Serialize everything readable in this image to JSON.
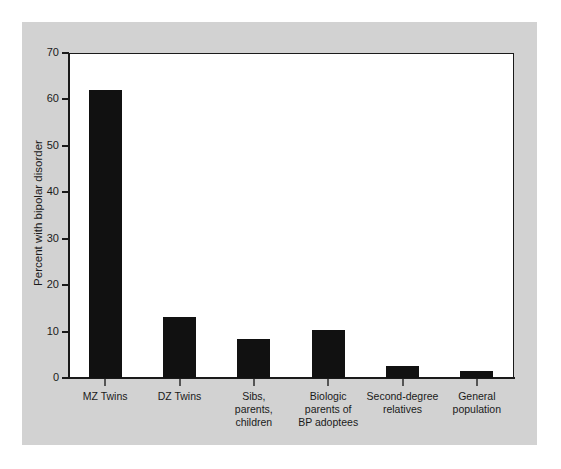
{
  "chart_data": {
    "type": "bar",
    "title": "",
    "xlabel": "",
    "ylabel": "Percent with bipolar disorder",
    "ylim": [
      0,
      70
    ],
    "yticks": [
      0,
      10,
      20,
      30,
      40,
      50,
      60,
      70
    ],
    "ytick_labels": [
      "0",
      "10",
      "20",
      "30",
      "40",
      "50",
      "60",
      "70"
    ],
    "grid": false,
    "legend": null,
    "bar_color": "#111111",
    "plot_background": "#ffffff",
    "panel_background": "#d2d2d2",
    "categories": [
      "MZ Twins",
      "DZ Twins",
      "Sibs,\nparents,\nchildren",
      "Biologic\nparents of\nBP adoptees",
      "Second-degree\nrelatives",
      "General\npopulation"
    ],
    "values": [
      62,
      13.2,
      8.5,
      10.4,
      2.5,
      1.5
    ]
  }
}
